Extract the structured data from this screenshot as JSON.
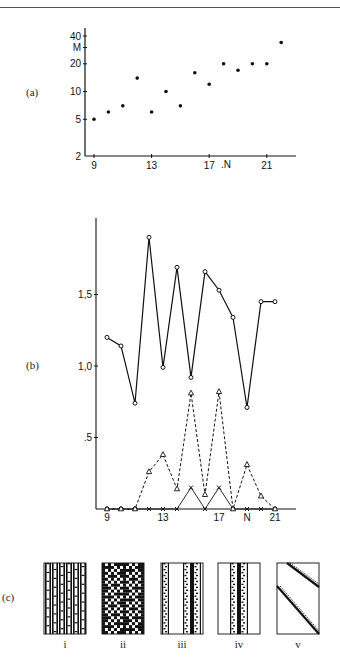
{
  "panels": {
    "a": {
      "label": "(a)"
    },
    "b": {
      "label": "(b)"
    },
    "c": {
      "label": "(c)"
    }
  },
  "chart_data": [
    {
      "id": "a",
      "type": "scatter",
      "title": "",
      "xlabel": "N",
      "ylabel": "M",
      "yscale": "log",
      "xlim": [
        8.5,
        23.5
      ],
      "ylim": [
        2,
        45
      ],
      "x_ticks": [
        9,
        13,
        17,
        21
      ],
      "x_tick_labels": [
        "9",
        "13",
        "17",
        "21"
      ],
      "y_ticks": [
        2,
        5,
        10,
        20,
        40
      ],
      "y_tick_labels": [
        "2",
        "5",
        "10",
        "20",
        "40"
      ],
      "y_axis_marker": {
        "label": "M",
        "value": 30
      },
      "x_axis_marker": {
        "label": ".N",
        "value": 18.5
      },
      "grid": false,
      "series": [
        {
          "name": "M",
          "marker": "dot",
          "x": [
            9,
            10,
            11,
            12,
            13,
            14,
            15,
            16,
            17,
            18,
            19,
            20,
            21,
            22
          ],
          "values": [
            5,
            6,
            7,
            14,
            6,
            10,
            7,
            16,
            12,
            20,
            17,
            20,
            20,
            34
          ]
        }
      ]
    },
    {
      "id": "b",
      "type": "line",
      "title": "",
      "xlabel": "N",
      "ylabel": "",
      "xlim": [
        8.2,
        22.5
      ],
      "ylim": [
        0,
        2.0
      ],
      "x_ticks": [
        9,
        13,
        17,
        21
      ],
      "x_tick_labels": [
        "9",
        "13",
        "17",
        "21"
      ],
      "x_axis_marker": {
        "label": "N",
        "value": 19
      },
      "y_ticks": [
        0.5,
        1.0,
        1.5
      ],
      "y_tick_labels": [
        ".5",
        "1,0",
        "1,5"
      ],
      "grid": false,
      "categories": [
        9,
        10,
        11,
        12,
        13,
        14,
        15,
        16,
        17,
        18,
        19,
        20,
        21
      ],
      "series": [
        {
          "name": "circles",
          "marker": "open-circle",
          "line": "solid",
          "values": [
            1.2,
            1.14,
            0.74,
            1.9,
            0.99,
            1.69,
            0.92,
            1.66,
            1.53,
            1.34,
            0.71,
            1.45,
            1.45
          ]
        },
        {
          "name": "triangles",
          "marker": "open-triangle",
          "line": "dashed",
          "values": [
            0,
            0,
            0,
            0.26,
            0.38,
            0.14,
            0.81,
            0.1,
            0.82,
            0,
            0.31,
            0.09,
            0
          ]
        },
        {
          "name": "crosses",
          "marker": "cross",
          "line": "solid-thin",
          "values": [
            0,
            0,
            0,
            0,
            0,
            0,
            0.15,
            0,
            0.15,
            0,
            0,
            0,
            0
          ]
        }
      ]
    }
  ],
  "patterns": [
    {
      "label": "i",
      "kind": "columns"
    },
    {
      "label": "ii",
      "kind": "dense-checker"
    },
    {
      "label": "iii",
      "kind": "two-bands"
    },
    {
      "label": "iv",
      "kind": "center-band"
    },
    {
      "label": "v",
      "kind": "diagonal-gliders"
    }
  ]
}
